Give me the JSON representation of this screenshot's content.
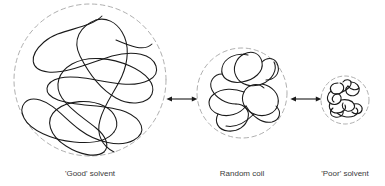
{
  "figure": {
    "background_color": "#ffffff",
    "chain_color": "#1a1a1a",
    "boundary_color": "#9a9a9a",
    "arrow_color": "#1a1a1a",
    "label_color": "#3a3a3a"
  },
  "panels": [
    {
      "id": "good-solvent",
      "label": "'Good' solvent",
      "state": "expanded coil",
      "boundary": "dashed-circle",
      "center_x": 90,
      "center_y": 80,
      "radius": 76
    },
    {
      "id": "random-coil",
      "label": "Random coil",
      "state": "unperturbed coil",
      "boundary": "dashed-circle",
      "center_x": 242,
      "center_y": 93,
      "radius": 45
    },
    {
      "id": "poor-solvent",
      "label": "'Poor' solvent",
      "state": "collapsed globule",
      "boundary": "dashed-circle",
      "center_x": 345,
      "center_y": 100,
      "radius": 24
    }
  ],
  "connectors": [
    {
      "id": "arrow-good-random",
      "type": "double-headed-arrow",
      "from": "good-solvent",
      "to": "random-coil"
    },
    {
      "id": "arrow-random-poor",
      "type": "double-headed-arrow",
      "from": "random-coil",
      "to": "poor-solvent"
    }
  ]
}
